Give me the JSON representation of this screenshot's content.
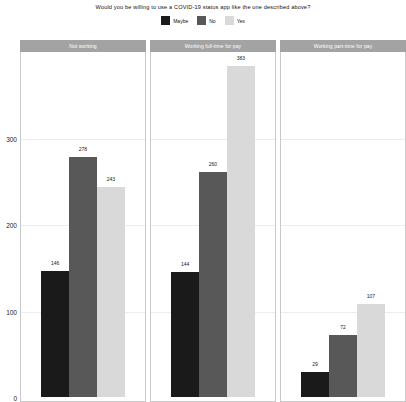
{
  "chart_data": {
    "type": "bar",
    "title": "Would you be willing to use a COVID-19 status app like the one described above?",
    "xlabel": "",
    "ylabel": "",
    "ylim": [
      0,
      400
    ],
    "yticks": [
      0,
      100,
      200,
      300
    ],
    "ytick_labels": [
      "0",
      "100",
      "200",
      "300"
    ],
    "grid": true,
    "legend_position": "top",
    "facet": true,
    "facets": [
      "Not working",
      "Working full-time for pay",
      "Working part-time for pay"
    ],
    "categories": [
      "Maybe",
      "No",
      "Yes"
    ],
    "colors": {
      "Maybe": "#1a1a1a",
      "No": "#585858",
      "Yes": "#d9d9d9"
    },
    "panels": [
      {
        "facet_label": "Not working",
        "bars": [
          {
            "category": "Maybe",
            "value": 146,
            "label": "146",
            "color": "#1a1a1a"
          },
          {
            "category": "No",
            "value": 278,
            "label": "278",
            "color": "#585858"
          },
          {
            "category": "Yes",
            "value": 243,
            "label": "243",
            "color": "#d9d9d9"
          }
        ]
      },
      {
        "facet_label": "Working full-time for pay",
        "bars": [
          {
            "category": "Maybe",
            "value": 144,
            "label": "144",
            "color": "#1a1a1a"
          },
          {
            "category": "No",
            "value": 260,
            "label": "260",
            "color": "#585858"
          },
          {
            "category": "Yes",
            "value": 383,
            "label": "383",
            "color": "#d9d9d9"
          }
        ]
      },
      {
        "facet_label": "Working part-time for pay",
        "bars": [
          {
            "category": "Maybe",
            "value": 29,
            "label": "29",
            "color": "#1a1a1a"
          },
          {
            "category": "No",
            "value": 72,
            "label": "72",
            "color": "#585858"
          },
          {
            "category": "Yes",
            "value": 107,
            "label": "107",
            "color": "#d9d9d9"
          }
        ]
      }
    ],
    "series": [
      {
        "name": "Maybe",
        "values": [
          146,
          144,
          29
        ]
      },
      {
        "name": "No",
        "values": [
          278,
          260,
          72
        ]
      },
      {
        "name": "Yes",
        "values": [
          243,
          383,
          107
        ]
      }
    ],
    "legend": [
      {
        "label": "Maybe",
        "color": "#1a1a1a"
      },
      {
        "label": "No",
        "color": "#585858"
      },
      {
        "label": "Yes",
        "color": "#d9d9d9"
      }
    ]
  }
}
